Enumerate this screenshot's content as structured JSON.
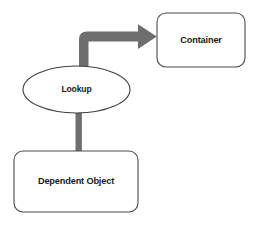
{
  "diagram": {
    "background_color": "#ffffff",
    "node_stroke_color": "#4c4c4c",
    "node_fill_color": "#ffffff",
    "connector_color": "#6e6e6e",
    "text_color": "#1b1b1b",
    "nodes": [
      {
        "id": "container",
        "label": "Container",
        "shape": "rounded-rectangle",
        "x": 157,
        "y": 13,
        "width": 88,
        "height": 54,
        "corner_radius": 9
      },
      {
        "id": "lookup",
        "label": "Lookup",
        "shape": "ellipse",
        "cx": 76.5,
        "cy": 89.5,
        "rx": 53.5,
        "ry": 23.5
      },
      {
        "id": "dependent-object",
        "label": "Dependent Object",
        "shape": "rounded-rectangle",
        "x": 14,
        "y": 151,
        "width": 124,
        "height": 61,
        "corner_radius": 9
      }
    ],
    "connectors": [
      {
        "id": "lookup-to-container",
        "from": "lookup",
        "to": "container",
        "style": "elbow-arrow",
        "direction": "up-then-right",
        "arrowhead": "filled-triangle",
        "thickness": 9
      },
      {
        "id": "lookup-to-dependent-object",
        "from": "lookup",
        "to": "dependent-object",
        "style": "straight-line",
        "direction": "down",
        "arrowhead": "none",
        "thickness": 6
      }
    ]
  }
}
